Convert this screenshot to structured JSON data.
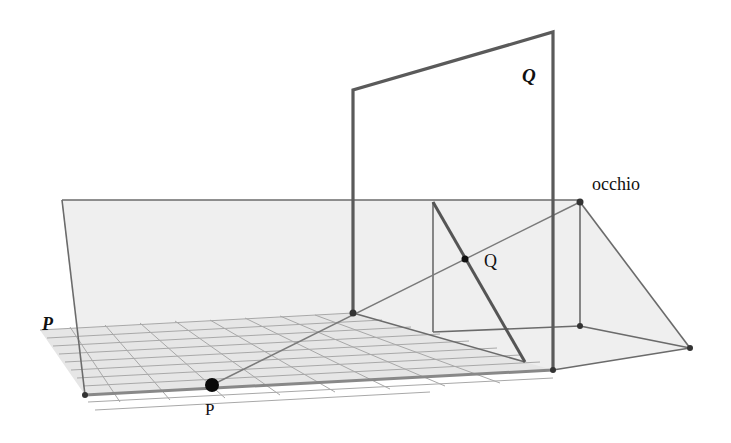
{
  "diagram": {
    "labels": {
      "plane_Q": "Q",
      "plane_P": "P",
      "eye": "occhio",
      "point_Q": "Q",
      "point_P": "P"
    },
    "colors": {
      "background": "#ffffff",
      "plane_fill": "#efefef",
      "edge": "#6b6b6b",
      "frame": "#5a5a5a",
      "grid": "#a8a8a8",
      "point": "#111111"
    },
    "points": {
      "eye": [
        580,
        202
      ],
      "eye_foot": [
        580,
        326
      ],
      "far_right": [
        690,
        348
      ],
      "Q": [
        465,
        259
      ],
      "P": [
        212,
        385
      ],
      "frame_base": [
        353,
        313
      ],
      "bottom_left": [
        85,
        395
      ],
      "bottom_right": [
        553,
        370
      ]
    }
  }
}
